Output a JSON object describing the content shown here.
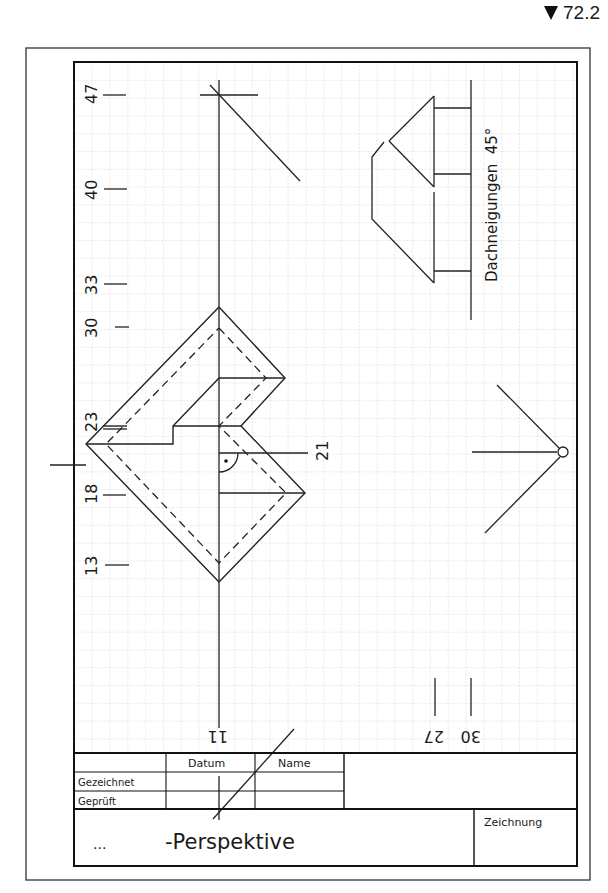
{
  "task": {
    "number": "72.2",
    "marker": "triangle-down"
  },
  "drawing": {
    "axis_labels_left": [
      "47",
      "40",
      "33",
      "30",
      "23",
      "18",
      "13"
    ],
    "axis_labels_bottom": [
      "11",
      "27",
      "30"
    ],
    "label_right_21": "21",
    "roof_pitch_label": "Dachneigungen  45°",
    "station_point": "circle"
  },
  "title_block": {
    "col_datum": "Datum",
    "col_name": "Name",
    "row_gezeichnet": "Gezeichnet",
    "row_geprueft": "Geprüft",
    "title_prefix": "...",
    "title": "-Perspektive",
    "drawing_label": "Zeichnung"
  }
}
